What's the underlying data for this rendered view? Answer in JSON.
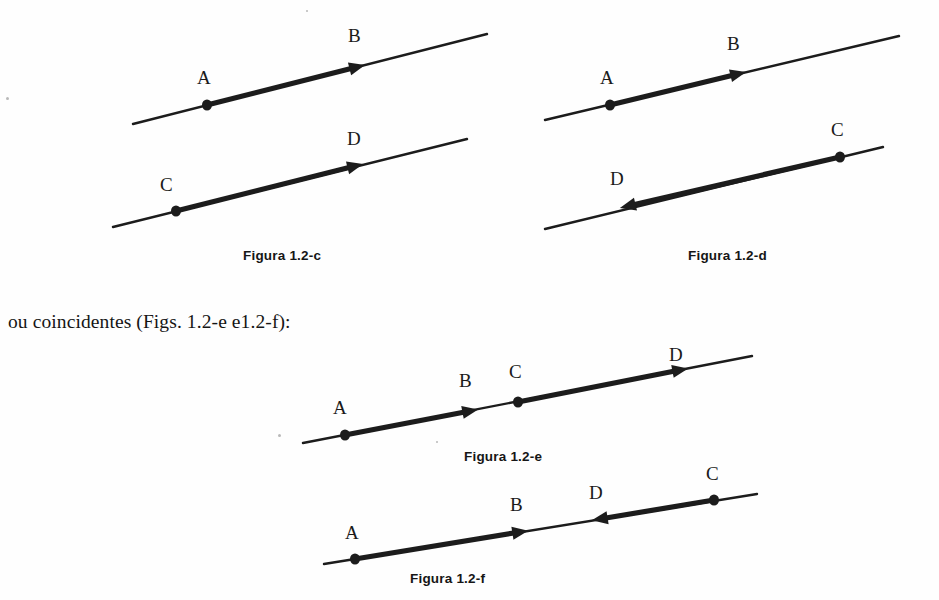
{
  "page": {
    "background_color": "#fefefe",
    "ink_color": "#1c1c1c",
    "width": 939,
    "height": 600
  },
  "body_text": {
    "line_1": "ou coincidentes (Figs. 1.2-e e1.2-f):",
    "x": 8,
    "y": 311
  },
  "figures": [
    {
      "id": "figura-1-2-c",
      "caption": "Figura 1.2-c",
      "caption_x": 243,
      "caption_y": 248,
      "description": "Dois segmentos orientados paralelos e de mesmo sentido",
      "lines": [
        {
          "name": "line-ab",
          "x1": 133,
          "y1": 124,
          "x2": 487,
          "y2": 34,
          "segment": {
            "from_x": 207,
            "from_y": 105,
            "to_x": 357,
            "to_y": 67
          },
          "points": [
            {
              "label": "A",
              "kind": "dot",
              "x": 207,
              "y": 105,
              "label_x": 197,
              "label_y": 68
            }
          ],
          "arrows": [
            {
              "label": "B",
              "kind": "arrow",
              "x": 357,
              "y": 67,
              "direction": "right",
              "label_x": 348,
              "label_y": 26
            }
          ]
        },
        {
          "name": "line-cd",
          "x1": 113,
          "y1": 227,
          "x2": 467,
          "y2": 139,
          "segment": {
            "from_x": 176,
            "from_y": 211,
            "to_x": 355,
            "to_y": 166
          },
          "points": [
            {
              "label": "C",
              "kind": "dot",
              "x": 176,
              "y": 211,
              "label_x": 160,
              "label_y": 175
            }
          ],
          "arrows": [
            {
              "label": "D",
              "kind": "arrow",
              "x": 355,
              "y": 166,
              "direction": "right",
              "label_x": 347,
              "label_y": 129
            }
          ]
        }
      ]
    },
    {
      "id": "figura-1-2-d",
      "caption": "Figura 1.2-d",
      "caption_x": 688,
      "caption_y": 248,
      "description": "Dois segmentos orientados paralelos e de sentidos opostos",
      "lines": [
        {
          "name": "line-ab",
          "x1": 545,
          "y1": 120,
          "x2": 899,
          "y2": 36,
          "segment": {
            "from_x": 610,
            "from_y": 105,
            "to_x": 738,
            "to_y": 74
          },
          "points": [
            {
              "label": "A",
              "kind": "dot",
              "x": 610,
              "y": 105,
              "label_x": 600,
              "label_y": 68
            }
          ],
          "arrows": [
            {
              "label": "B",
              "kind": "arrow",
              "x": 738,
              "y": 74,
              "direction": "right",
              "label_x": 727,
              "label_y": 34
            }
          ]
        },
        {
          "name": "line-cd",
          "x1": 545,
          "y1": 229,
          "x2": 883,
          "y2": 147,
          "segment": {
            "from_x": 840,
            "from_y": 157,
            "to_x": 628,
            "to_y": 206
          },
          "points": [
            {
              "label": "C",
              "kind": "dot",
              "x": 840,
              "y": 157,
              "label_x": 831,
              "label_y": 120
            }
          ],
          "arrows": [
            {
              "label": "D",
              "kind": "arrow",
              "x": 628,
              "y": 206,
              "direction": "left",
              "label_x": 610,
              "label_y": 169
            }
          ]
        }
      ]
    },
    {
      "id": "figura-1-2-e",
      "caption": "Figura 1.2-e",
      "caption_x": 464,
      "caption_y": 449,
      "description": "Segmentos orientados colineares de mesmo sentido",
      "lines": [
        {
          "name": "line-abcd",
          "x1": 303,
          "y1": 443,
          "x2": 752,
          "y2": 356,
          "segment": {
            "from_x": 345,
            "from_y": 435,
            "to_x": 470,
            "to_y": 411
          },
          "segment2": {
            "from_x": 518,
            "from_y": 402,
            "to_x": 680,
            "to_y": 370
          },
          "points": [
            {
              "label": "A",
              "kind": "dot",
              "x": 345,
              "y": 435,
              "label_x": 333,
              "label_y": 398
            },
            {
              "label": "C",
              "kind": "dot",
              "x": 518,
              "y": 402,
              "label_x": 509,
              "label_y": 362
            }
          ],
          "arrows": [
            {
              "label": "B",
              "kind": "arrow",
              "x": 470,
              "y": 411,
              "direction": "right",
              "label_x": 459,
              "label_y": 371
            },
            {
              "label": "D",
              "kind": "arrow",
              "x": 680,
              "y": 370,
              "direction": "right",
              "label_x": 669,
              "label_y": 345
            }
          ]
        }
      ]
    },
    {
      "id": "figura-1-2-f",
      "caption": "Figura 1.2-f",
      "caption_x": 410,
      "caption_y": 571,
      "description": "Segmentos orientados colineares de sentidos opostos",
      "lines": [
        {
          "name": "line-abcd",
          "x1": 324,
          "y1": 564,
          "x2": 757,
          "y2": 494,
          "segment": {
            "from_x": 355,
            "from_y": 559,
            "to_x": 520,
            "to_y": 532
          },
          "segment2": {
            "from_x": 714,
            "from_y": 500,
            "to_x": 600,
            "to_y": 519
          },
          "points": [
            {
              "label": "A",
              "kind": "dot",
              "x": 355,
              "y": 559,
              "label_x": 345,
              "label_y": 523
            },
            {
              "label": "C",
              "kind": "dot",
              "x": 714,
              "y": 500,
              "label_x": 706,
              "label_y": 464
            }
          ],
          "arrows": [
            {
              "label": "B",
              "kind": "arrow",
              "x": 520,
              "y": 532,
              "direction": "right",
              "label_x": 510,
              "label_y": 495
            },
            {
              "label": "D",
              "kind": "arrow",
              "x": 600,
              "y": 519,
              "direction": "left",
              "label_x": 589,
              "label_y": 483
            }
          ]
        }
      ]
    }
  ],
  "specks": [
    {
      "x": 306,
      "y": 10,
      "size": 2
    },
    {
      "x": 6,
      "y": 97,
      "size": 3
    },
    {
      "x": 278,
      "y": 434,
      "size": 3
    },
    {
      "x": 436,
      "y": 441,
      "size": 2
    }
  ]
}
